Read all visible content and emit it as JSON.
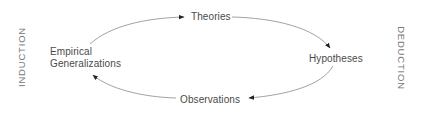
{
  "diagram": {
    "nodes": {
      "theories": "Theories",
      "hypotheses": "Hypotheses",
      "observations": "Observations",
      "empirical_line1": "Empirical",
      "empirical_line2": "Generalizations"
    },
    "side_labels": {
      "left": "INDUCTION",
      "right": "DEDUCTION"
    },
    "edges": [
      {
        "from": "Empirical Generalizations",
        "to": "Theories"
      },
      {
        "from": "Theories",
        "to": "Hypotheses"
      },
      {
        "from": "Hypotheses",
        "to": "Observations"
      },
      {
        "from": "Observations",
        "to": "Empirical Generalizations"
      }
    ],
    "colors": {
      "text": "#4a4a4a",
      "line": "#888888",
      "arrow": "#222222"
    }
  }
}
